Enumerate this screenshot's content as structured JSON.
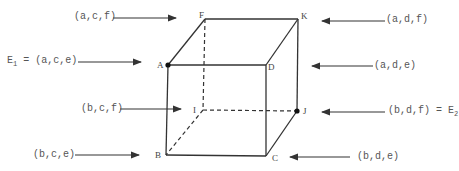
{
  "diagram": {
    "type": "cube",
    "vertices": [
      {
        "id": "F",
        "label": "F",
        "tuple": "(a,c,f)",
        "x": 205,
        "y": 19
      },
      {
        "id": "K",
        "label": "K",
        "tuple": "(a,d,f)",
        "x": 298,
        "y": 19
      },
      {
        "id": "A",
        "label": "A",
        "tuple": "(a,c,e)",
        "x": 168,
        "y": 65,
        "marked": true,
        "name": "E",
        "name_sub": "1"
      },
      {
        "id": "D",
        "label": "D",
        "tuple": "(a,d,e)",
        "x": 266,
        "y": 65
      },
      {
        "id": "I",
        "label": "I",
        "tuple": "(b,c,f)",
        "x": 203,
        "y": 110
      },
      {
        "id": "J",
        "label": "J",
        "tuple": "(b,d,f)",
        "x": 297,
        "y": 111,
        "marked": true,
        "name": "E",
        "name_sub": "2"
      },
      {
        "id": "B",
        "label": "B",
        "tuple": "(b,c,e)",
        "x": 166,
        "y": 155
      },
      {
        "id": "C",
        "label": "C",
        "tuple": "(b,d,e)",
        "x": 266,
        "y": 156
      }
    ],
    "labels": {
      "F": "(a,c,f)",
      "K": "(a,d,f)",
      "A_prefix": "E",
      "A_sub": "1",
      "A_eq": " = (a,c,e)",
      "D": "(a,d,e)",
      "I": "(b,c,f)",
      "J_text": "(b,d,f) = E",
      "J_sub": "2",
      "B": "(b,c,e)",
      "C": "(b,d,e)"
    },
    "solid_edges": [
      [
        "F",
        "K"
      ],
      [
        "A",
        "D"
      ],
      [
        "F",
        "A"
      ],
      [
        "K",
        "D"
      ],
      [
        "A",
        "B"
      ],
      [
        "D",
        "C"
      ],
      [
        "K",
        "J"
      ],
      [
        "B",
        "C"
      ],
      [
        "J",
        "C"
      ]
    ],
    "dashed_edges": [
      [
        "F",
        "I"
      ],
      [
        "I",
        "J"
      ],
      [
        "I",
        "B"
      ]
    ]
  }
}
